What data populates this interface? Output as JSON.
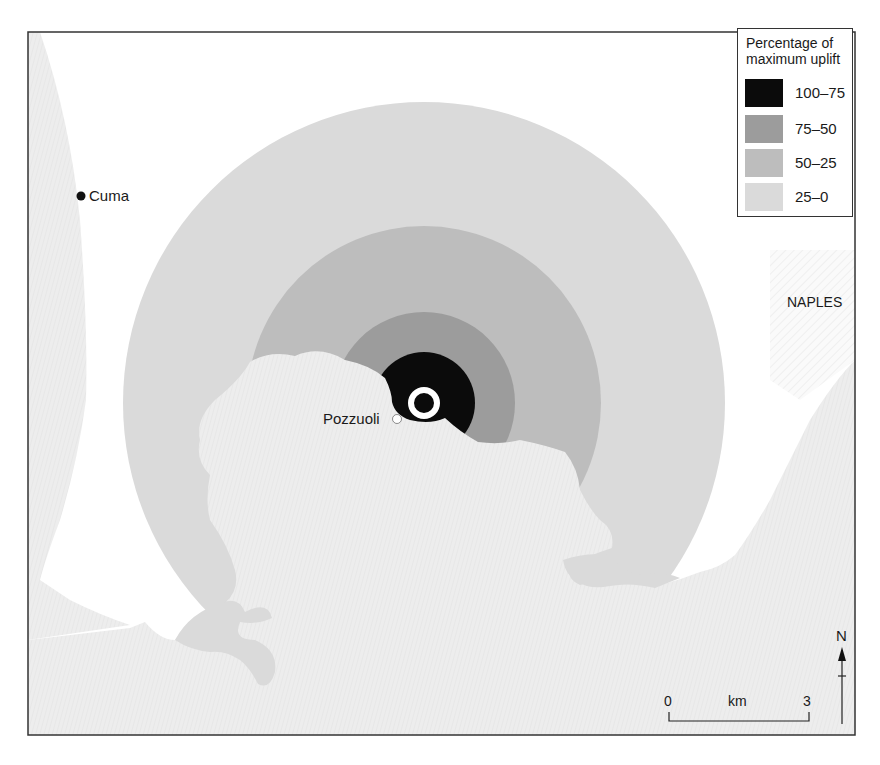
{
  "map": {
    "frame": {
      "x": 28,
      "y": 32,
      "width": 827,
      "height": 703
    },
    "colors": {
      "land": "#ffffff",
      "sea": "#ececec",
      "urban_hatch": "#f3f3f3",
      "zone_100_75": "#0b0b0b",
      "zone_75_50": "#9c9c9c",
      "zone_50_25": "#bdbdbd",
      "zone_25_0": "#dadada",
      "border": "#333333"
    },
    "center": {
      "x": 424,
      "y": 403
    },
    "zone_radii": {
      "zone_25_0": 301,
      "zone_50_25": 177,
      "zone_75_50": 91,
      "zone_100_75": 51
    }
  },
  "labels": {
    "cuma": "Cuma",
    "pozzuoli": "Pozzuoli",
    "naples": "NAPLES"
  },
  "legend": {
    "title_line1": "Percentage of",
    "title_line2": "maximum uplift",
    "items": [
      {
        "label": "100–75",
        "color": "#0b0b0b"
      },
      {
        "label": "75–50",
        "color": "#9c9c9c"
      },
      {
        "label": "50–25",
        "color": "#bdbdbd"
      },
      {
        "label": "25–0",
        "color": "#dadada"
      }
    ]
  },
  "scale_bar": {
    "start": "0",
    "unit": "km",
    "end": "3"
  },
  "north_arrow": {
    "label": "N"
  }
}
